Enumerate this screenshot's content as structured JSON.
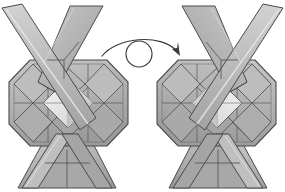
{
  "diagram": {
    "type": "origami-instruction",
    "background_color": "#ffffff",
    "panels": [
      {
        "id": "before",
        "name": "model-front-view",
        "label": "",
        "description": "Folded modular origami unit seen from the front: an octagonal body with a woven square-within-square center and four long flat arms crossing in an X above and below."
      },
      {
        "id": "after",
        "name": "model-back-view",
        "label": "",
        "description": "The same unit after being turned over, mirrored left to right."
      }
    ],
    "symbol": {
      "name": "turn-over-arrow",
      "meaning": "Turn the model over",
      "glyph_parts": [
        "curved-arc-arrow",
        "circle"
      ],
      "stroke_color": "#3a3a3a"
    },
    "palette": {
      "paper_light": "#d8d8d8",
      "paper_mid": "#b4b4b4",
      "paper_shade": "#9a9a9a",
      "paper_dark": "#8a8a8a",
      "paper_deep": "#6f6f6f",
      "highlight": "#f0f0f0",
      "crease_line": "#5a5a5a",
      "outline": "#4a4a4a"
    },
    "geometry": {
      "figure_width": 137,
      "figure_height": 190,
      "left_offset_x": 0,
      "right_offset_x": 148,
      "arrow_offset": {
        "x": 98,
        "y": 22
      }
    }
  }
}
